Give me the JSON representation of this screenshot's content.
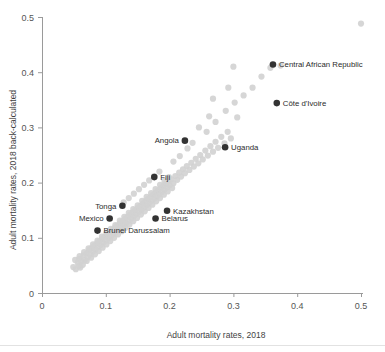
{
  "chart_data": {
    "type": "scatter",
    "title": "",
    "xlabel": "Adult mortality rates, 2018",
    "ylabel": "Adult mortality rates, 2018 back-calculated",
    "xlim": [
      0,
      0.5
    ],
    "ylim": [
      0,
      0.5
    ],
    "xticks": [
      "0",
      "0.1",
      "0.2",
      "0.3",
      "0.4",
      "0.5"
    ],
    "xtick_values": [
      0,
      0.1,
      0.2,
      0.3,
      0.4,
      0.5
    ],
    "yticks": [
      "0",
      "0.1",
      "0.2",
      "0.3",
      "0.4",
      "0.5"
    ],
    "ytick_values": [
      0,
      0.1,
      0.2,
      0.3,
      0.4,
      0.5
    ],
    "grid": false,
    "legend": "none",
    "series": [
      {
        "name": "All countries",
        "color": "#d2d2d2",
        "marker": "circle",
        "points": [
          [
            0.049,
            0.047
          ],
          [
            0.053,
            0.043
          ],
          [
            0.056,
            0.055
          ],
          [
            0.06,
            0.046
          ],
          [
            0.058,
            0.062
          ],
          [
            0.062,
            0.057
          ],
          [
            0.065,
            0.068
          ],
          [
            0.067,
            0.06
          ],
          [
            0.07,
            0.072
          ],
          [
            0.072,
            0.065
          ],
          [
            0.074,
            0.078
          ],
          [
            0.076,
            0.07
          ],
          [
            0.078,
            0.082
          ],
          [
            0.08,
            0.075
          ],
          [
            0.082,
            0.086
          ],
          [
            0.084,
            0.079
          ],
          [
            0.086,
            0.09
          ],
          [
            0.088,
            0.083
          ],
          [
            0.09,
            0.094
          ],
          [
            0.092,
            0.087
          ],
          [
            0.094,
            0.098
          ],
          [
            0.096,
            0.091
          ],
          [
            0.098,
            0.102
          ],
          [
            0.1,
            0.095
          ],
          [
            0.102,
            0.106
          ],
          [
            0.104,
            0.099
          ],
          [
            0.106,
            0.11
          ],
          [
            0.108,
            0.103
          ],
          [
            0.11,
            0.114
          ],
          [
            0.112,
            0.107
          ],
          [
            0.114,
            0.118
          ],
          [
            0.116,
            0.111
          ],
          [
            0.118,
            0.122
          ],
          [
            0.12,
            0.115
          ],
          [
            0.122,
            0.126
          ],
          [
            0.124,
            0.119
          ],
          [
            0.126,
            0.13
          ],
          [
            0.128,
            0.123
          ],
          [
            0.13,
            0.134
          ],
          [
            0.132,
            0.127
          ],
          [
            0.134,
            0.138
          ],
          [
            0.136,
            0.131
          ],
          [
            0.138,
            0.142
          ],
          [
            0.14,
            0.135
          ],
          [
            0.142,
            0.146
          ],
          [
            0.144,
            0.139
          ],
          [
            0.146,
            0.15
          ],
          [
            0.148,
            0.143
          ],
          [
            0.15,
            0.154
          ],
          [
            0.152,
            0.147
          ],
          [
            0.154,
            0.158
          ],
          [
            0.156,
            0.151
          ],
          [
            0.158,
            0.162
          ],
          [
            0.16,
            0.155
          ],
          [
            0.162,
            0.166
          ],
          [
            0.164,
            0.159
          ],
          [
            0.166,
            0.17
          ],
          [
            0.168,
            0.163
          ],
          [
            0.17,
            0.174
          ],
          [
            0.172,
            0.167
          ],
          [
            0.174,
            0.178
          ],
          [
            0.176,
            0.171
          ],
          [
            0.178,
            0.182
          ],
          [
            0.18,
            0.175
          ],
          [
            0.182,
            0.186
          ],
          [
            0.184,
            0.179
          ],
          [
            0.186,
            0.19
          ],
          [
            0.188,
            0.183
          ],
          [
            0.19,
            0.194
          ],
          [
            0.192,
            0.187
          ],
          [
            0.194,
            0.198
          ],
          [
            0.196,
            0.191
          ],
          [
            0.198,
            0.202
          ],
          [
            0.2,
            0.195
          ],
          [
            0.203,
            0.206
          ],
          [
            0.206,
            0.199
          ],
          [
            0.209,
            0.212
          ],
          [
            0.212,
            0.205
          ],
          [
            0.215,
            0.218
          ],
          [
            0.218,
            0.211
          ],
          [
            0.221,
            0.224
          ],
          [
            0.224,
            0.217
          ],
          [
            0.227,
            0.23
          ],
          [
            0.231,
            0.223
          ],
          [
            0.234,
            0.236
          ],
          [
            0.238,
            0.229
          ],
          [
            0.241,
            0.243
          ],
          [
            0.245,
            0.235
          ],
          [
            0.248,
            0.25
          ],
          [
            0.252,
            0.242
          ],
          [
            0.256,
            0.258
          ],
          [
            0.26,
            0.249
          ],
          [
            0.264,
            0.266
          ],
          [
            0.268,
            0.256
          ],
          [
            0.272,
            0.274
          ],
          [
            0.276,
            0.263
          ],
          [
            0.281,
            0.283
          ],
          [
            0.286,
            0.271
          ],
          [
            0.291,
            0.292
          ],
          [
            0.296,
            0.28
          ],
          [
            0.246,
            0.3
          ],
          [
            0.258,
            0.292
          ],
          [
            0.228,
            0.262
          ],
          [
            0.236,
            0.272
          ],
          [
            0.216,
            0.248
          ],
          [
            0.206,
            0.238
          ],
          [
            0.262,
            0.32
          ],
          [
            0.272,
            0.31
          ],
          [
            0.288,
            0.33
          ],
          [
            0.302,
            0.345
          ],
          [
            0.316,
            0.358
          ],
          [
            0.33,
            0.372
          ],
          [
            0.344,
            0.392
          ],
          [
            0.358,
            0.408
          ],
          [
            0.374,
            0.412
          ],
          [
            0.3,
            0.41
          ],
          [
            0.292,
            0.372
          ],
          [
            0.306,
            0.318
          ],
          [
            0.5,
            0.488
          ],
          [
            0.268,
            0.352
          ],
          [
            0.058,
            0.049
          ],
          [
            0.064,
            0.051
          ],
          [
            0.07,
            0.058
          ],
          [
            0.077,
            0.064
          ],
          [
            0.083,
            0.07
          ],
          [
            0.089,
            0.076
          ],
          [
            0.095,
            0.082
          ],
          [
            0.101,
            0.088
          ],
          [
            0.107,
            0.094
          ],
          [
            0.113,
            0.1
          ],
          [
            0.119,
            0.106
          ],
          [
            0.125,
            0.112
          ],
          [
            0.131,
            0.118
          ],
          [
            0.137,
            0.124
          ],
          [
            0.143,
            0.13
          ],
          [
            0.149,
            0.136
          ],
          [
            0.155,
            0.142
          ],
          [
            0.161,
            0.148
          ],
          [
            0.167,
            0.154
          ],
          [
            0.173,
            0.16
          ],
          [
            0.179,
            0.166
          ],
          [
            0.185,
            0.172
          ],
          [
            0.191,
            0.178
          ],
          [
            0.197,
            0.184
          ],
          [
            0.204,
            0.19
          ],
          [
            0.052,
            0.06
          ],
          [
            0.059,
            0.067
          ],
          [
            0.066,
            0.074
          ],
          [
            0.073,
            0.081
          ],
          [
            0.08,
            0.088
          ],
          [
            0.087,
            0.095
          ],
          [
            0.094,
            0.102
          ],
          [
            0.101,
            0.109
          ],
          [
            0.108,
            0.116
          ],
          [
            0.115,
            0.123
          ],
          [
            0.122,
            0.131
          ],
          [
            0.129,
            0.138
          ],
          [
            0.136,
            0.145
          ],
          [
            0.143,
            0.152
          ],
          [
            0.15,
            0.159
          ],
          [
            0.157,
            0.167
          ],
          [
            0.164,
            0.174
          ],
          [
            0.171,
            0.181
          ],
          [
            0.178,
            0.188
          ],
          [
            0.185,
            0.196
          ],
          [
            0.192,
            0.203
          ],
          [
            0.199,
            0.21
          ],
          [
            0.16,
            0.196
          ],
          [
            0.168,
            0.204
          ],
          [
            0.176,
            0.212
          ],
          [
            0.184,
            0.22
          ],
          [
            0.152,
            0.188
          ],
          [
            0.144,
            0.18
          ],
          [
            0.136,
            0.172
          ],
          [
            0.128,
            0.164
          ]
        ]
      },
      {
        "name": "Highlighted countries",
        "color": "#333333",
        "marker": "circle",
        "points": [
          {
            "label": "Central African Republic",
            "x": 0.362,
            "y": 0.414,
            "label_side": "right"
          },
          {
            "label": "Côte d'Ivoire",
            "x": 0.368,
            "y": 0.344,
            "label_side": "right"
          },
          {
            "label": "Uganda",
            "x": 0.287,
            "y": 0.264,
            "label_side": "right"
          },
          {
            "label": "Angola",
            "x": 0.224,
            "y": 0.276,
            "label_side": "left"
          },
          {
            "label": "Fiji",
            "x": 0.176,
            "y": 0.21,
            "label_side": "right"
          },
          {
            "label": "Kazakhstan",
            "x": 0.196,
            "y": 0.149,
            "label_side": "right"
          },
          {
            "label": "Belarus",
            "x": 0.178,
            "y": 0.135,
            "label_side": "right"
          },
          {
            "label": "Tonga",
            "x": 0.126,
            "y": 0.158,
            "label_side": "left"
          },
          {
            "label": "Mexico",
            "x": 0.106,
            "y": 0.135,
            "label_side": "left"
          },
          {
            "label": "Brunei Darussalam",
            "x": 0.087,
            "y": 0.113,
            "label_side": "right"
          }
        ]
      }
    ]
  }
}
